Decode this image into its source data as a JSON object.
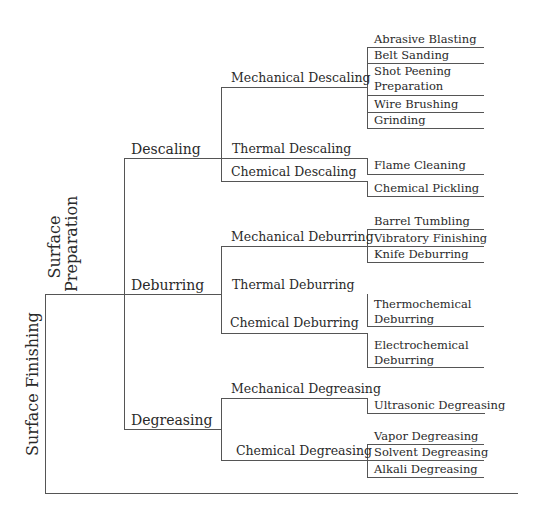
{
  "root": {
    "label": "Surface Finishing"
  },
  "branch": {
    "label_line1": "Surface",
    "label_line2": "Preparation"
  },
  "categories": [
    {
      "label": "Descaling",
      "methods": [
        {
          "label": "Mechanical Descaling",
          "techniques": [
            "Abrasive Blasting",
            "Belt Sanding",
            "Shot Peening Preparation",
            "Wire Brushing",
            "Grinding"
          ]
        },
        {
          "label": "Thermal Descaling",
          "techniques": [
            "Flame Cleaning"
          ]
        },
        {
          "label": "Chemical Descaling",
          "techniques": [
            "Chemical Pickling"
          ]
        }
      ]
    },
    {
      "label": "Deburring",
      "methods": [
        {
          "label": "Mechanical Deburring",
          "techniques": [
            "Barrel Tumbling",
            "Vibratory Finishing",
            "Knife Deburring"
          ]
        },
        {
          "label": "Thermal Deburring",
          "techniques": [
            "Thermochemical Deburring"
          ]
        },
        {
          "label": "Chemical Deburring",
          "techniques": [
            "Electrochemical Deburring"
          ]
        }
      ]
    },
    {
      "label": "Degreasing",
      "methods": [
        {
          "label": "Mechanical Degreasing",
          "techniques": [
            "Ultrasonic Degreasing"
          ]
        },
        {
          "label": "Chemical Degreasing",
          "techniques": [
            "Vapor Degreasing",
            "Solvent Degreasing",
            "Alkali Degreasing"
          ]
        }
      ]
    }
  ],
  "wrapped_labels": {
    "shot_peening_1": "Shot Peening",
    "shot_peening_2": "Preparation",
    "thermochemical_1": "Thermochemical",
    "thermochemical_2": "Deburring",
    "electrochemical_1": "Electrochemical",
    "electrochemical_2": "Deburring"
  }
}
